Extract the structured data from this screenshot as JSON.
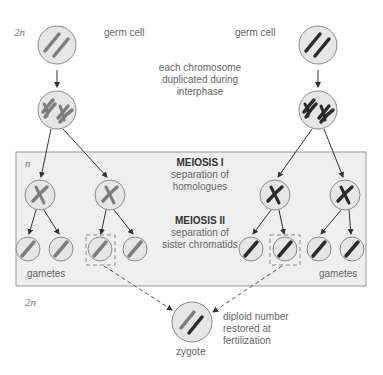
{
  "ploidy": {
    "top": "2n",
    "middle": "n",
    "bottom": "2n"
  },
  "labels": {
    "germ_cell_left": "germ cell",
    "germ_cell_right": "germ cell",
    "interphase_line1": "each chromosome",
    "interphase_line2": "duplicated during",
    "interphase_line3": "interphase",
    "meiosis1_title": "MEIOSIS I",
    "meiosis1_line1": "separation of",
    "meiosis1_line2": "homologues",
    "meiosis2_title": "MEIOSIS II",
    "meiosis2_line1": "separation of",
    "meiosis2_line2": "sister chromatids",
    "gametes_left": "gametes",
    "gametes_right": "gametes",
    "fertilization_line1": "diploid number",
    "fertilization_line2": "restored at",
    "fertilization_line3": "fertilization",
    "zygote": "zygote"
  },
  "colors": {
    "cell_fill": "#e6e6e6",
    "cell_stroke": "#8a8a8a",
    "maternal_chromosome": "#7d7d7d",
    "paternal_chromosome": "#2b2b2b",
    "meiosis_box_fill": "#efefef",
    "meiosis_box_stroke": "#9a9a9a",
    "arrow": "#333333"
  }
}
